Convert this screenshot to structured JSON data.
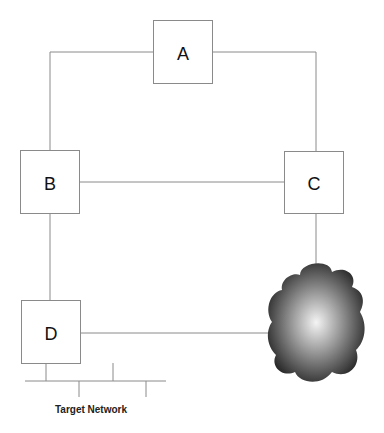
{
  "diagram": {
    "nodes": [
      {
        "id": "A",
        "label": "A"
      },
      {
        "id": "B",
        "label": "B"
      },
      {
        "id": "C",
        "label": "C"
      },
      {
        "id": "D",
        "label": "D"
      }
    ],
    "cloud": {
      "label": "Internet cloud"
    },
    "edges": [
      {
        "from": "A",
        "to": "B"
      },
      {
        "from": "A",
        "to": "C"
      },
      {
        "from": "B",
        "to": "C"
      },
      {
        "from": "B",
        "to": "D"
      },
      {
        "from": "C",
        "to": "cloud"
      },
      {
        "from": "D",
        "to": "cloud"
      }
    ],
    "target_network": {
      "label": "Target Network"
    },
    "colors": {
      "line": "#8a8a8a",
      "box_border": "#8a8a8a",
      "cloud_dark": "#2a2a2a",
      "cloud_light": "#f2f2f2"
    }
  }
}
